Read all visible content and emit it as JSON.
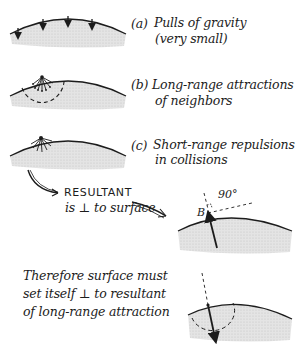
{
  "diagram": {
    "panels": [
      {
        "id": "a",
        "tag": "(a)",
        "line1": "Pulls of gravity",
        "line2": "(very small)"
      },
      {
        "id": "b",
        "tag": "(b)",
        "line1": "Long-range attractions",
        "line2": "of neighbors"
      },
      {
        "id": "c",
        "tag": "(c)",
        "line1": "Short-range repulsions",
        "line2": "in collisions"
      }
    ],
    "resultant": {
      "title": "RESULTANT",
      "subtitle": "is ⊥ to surface",
      "point_label": "B",
      "angle_label": "90°"
    },
    "conclusion": {
      "line1": "Therefore surface must",
      "line2": "set itself ⊥ to resultant",
      "line3": "of long-range attraction"
    },
    "colors": {
      "ink": "#1c1c1c",
      "shading": "#d9d9d9",
      "background": "#ffffff"
    }
  }
}
